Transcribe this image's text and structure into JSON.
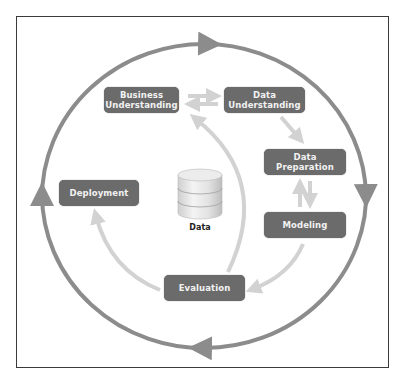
{
  "diagram": {
    "phases": [
      {
        "id": "business-understanding",
        "label": "Business\nUnderstanding"
      },
      {
        "id": "data-understanding",
        "label": "Data\nUnderstanding"
      },
      {
        "id": "data-preparation",
        "label": "Data\nPreparation"
      },
      {
        "id": "modeling",
        "label": "Modeling"
      },
      {
        "id": "evaluation",
        "label": "Evaluation"
      },
      {
        "id": "deployment",
        "label": "Deployment"
      }
    ],
    "center": {
      "icon": "database-icon",
      "label": "Data"
    },
    "edges": [
      {
        "from": "business-understanding",
        "to": "data-understanding"
      },
      {
        "from": "data-understanding",
        "to": "business-understanding"
      },
      {
        "from": "data-understanding",
        "to": "data-preparation"
      },
      {
        "from": "data-preparation",
        "to": "modeling"
      },
      {
        "from": "modeling",
        "to": "data-preparation"
      },
      {
        "from": "modeling",
        "to": "evaluation"
      },
      {
        "from": "evaluation",
        "to": "business-understanding"
      },
      {
        "from": "evaluation",
        "to": "deployment"
      }
    ],
    "outer_cycle": {
      "direction": "clockwise"
    },
    "colors": {
      "box_fill": "#6b6b6b",
      "box_text": "#f2f2f2",
      "outer_arrow": "#8c8c8c",
      "inner_arrow": "#d2d2d2",
      "frame": "#3a3a3a"
    }
  }
}
